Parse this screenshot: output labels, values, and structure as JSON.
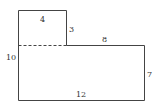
{
  "diagram": {
    "type": "composite-rectilinear-shape",
    "stroke_color": "#444444",
    "labels": {
      "top_width": "4",
      "notch_height": "3",
      "step_width": "8",
      "left_height": "10",
      "right_height": "7",
      "bottom_width": "12"
    }
  }
}
